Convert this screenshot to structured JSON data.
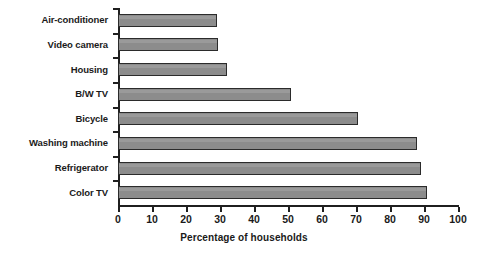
{
  "chart_data": {
    "type": "bar",
    "orientation": "horizontal",
    "title": "",
    "xlabel": "Percentage of households",
    "ylabel": "",
    "xlim": [
      0,
      100
    ],
    "xticks": [
      0,
      10,
      20,
      30,
      40,
      50,
      60,
      70,
      80,
      90,
      100
    ],
    "grid": false,
    "legend": null,
    "categories": [
      "Air-conditioner",
      "Video camera",
      "Housing",
      "B/W TV",
      "Bicycle",
      "Washing machine",
      "Refrigerator",
      "Color TV"
    ],
    "values": [
      29,
      29.5,
      32,
      51,
      70.5,
      88,
      89,
      91
    ],
    "bar_fill_color": "#8c8c8c",
    "bar_border_color": "#2b2b2b",
    "axis_color": "#1f1f1f",
    "background_color": "#ffffff"
  }
}
